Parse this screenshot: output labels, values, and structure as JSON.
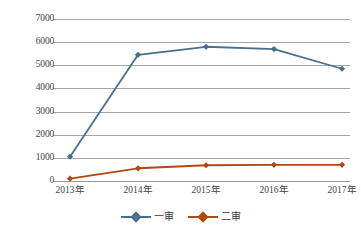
{
  "chart_data": {
    "type": "line",
    "title": "",
    "xlabel": "",
    "ylabel": "",
    "categories": [
      "2013年",
      "2014年",
      "2015年",
      "2016年",
      "2017年"
    ],
    "yticks": [
      0,
      1000,
      2000,
      3000,
      4000,
      5000,
      6000,
      7000
    ],
    "ytick_labels": [
      "0",
      "1000",
      "2000",
      "3000",
      "4000",
      "5000",
      "6000",
      "7000"
    ],
    "ylim": [
      0,
      7000
    ],
    "grid": true,
    "legend_position": "bottom-center",
    "series": [
      {
        "name": "一审",
        "color": "#4a6f8a",
        "marker": "diamond",
        "values": [
          1050,
          5450,
          5800,
          5700,
          4850
        ]
      },
      {
        "name": "二审",
        "color": "#b1480f",
        "marker": "diamond",
        "values": [
          100,
          550,
          680,
          700,
          700
        ]
      }
    ]
  },
  "colors": {
    "series_one": "#4a6f8a",
    "series_two": "#b1480f",
    "gridline": "#a6a6a6",
    "background": "#ffffff",
    "text": "#3a3a3a"
  }
}
